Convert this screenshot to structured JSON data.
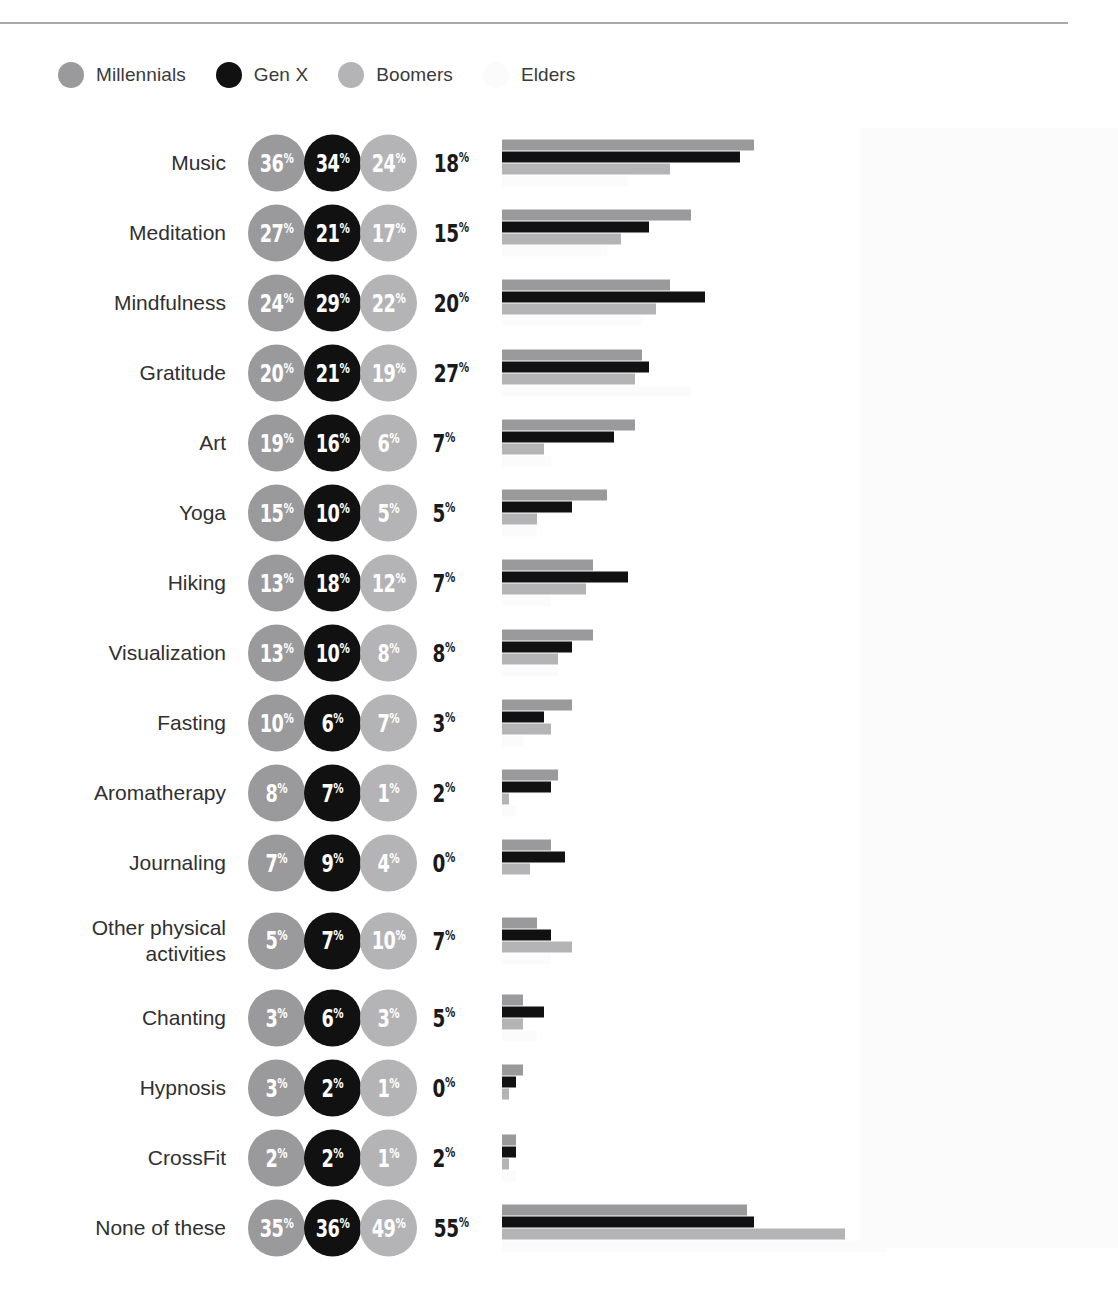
{
  "colors": {
    "millennials": "#9a9a9c",
    "genx": "#111111",
    "boomers": "#b4b4b6",
    "elders": "#fbfbfb",
    "elders_text": "#1a1a1a",
    "label_text": "#303032",
    "rule": "#a7a9ab",
    "background": "#ffffff"
  },
  "legend": {
    "items": [
      {
        "label": "Millennials",
        "color_key": "millennials"
      },
      {
        "label": "Gen X",
        "color_key": "genx"
      },
      {
        "label": "Boomers",
        "color_key": "boomers"
      },
      {
        "label": "Elders",
        "color_key": "elders"
      }
    ]
  },
  "chart_data": {
    "type": "bar",
    "title": "",
    "xlabel": "",
    "ylabel": "",
    "orientation": "horizontal",
    "grid": false,
    "legend_position": "top-left",
    "value_suffix": "%",
    "xlim": [
      0,
      60
    ],
    "px_per_percent": 7.0,
    "series": [
      {
        "name": "Millennials",
        "color": "#9a9a9c",
        "values": [
          36,
          27,
          24,
          20,
          19,
          15,
          13,
          13,
          10,
          8,
          7,
          5,
          3,
          3,
          2,
          35
        ]
      },
      {
        "name": "Gen X",
        "color": "#111111",
        "values": [
          34,
          21,
          29,
          21,
          16,
          10,
          18,
          10,
          6,
          7,
          9,
          7,
          6,
          2,
          2,
          36
        ]
      },
      {
        "name": "Boomers",
        "color": "#b4b4b6",
        "values": [
          24,
          17,
          22,
          19,
          6,
          5,
          12,
          8,
          7,
          1,
          4,
          10,
          3,
          1,
          1,
          49
        ]
      },
      {
        "name": "Elders",
        "color": "#fbfbfb",
        "values": [
          18,
          15,
          20,
          27,
          7,
          5,
          7,
          8,
          3,
          2,
          0,
          7,
          5,
          0,
          2,
          55
        ]
      }
    ],
    "categories": [
      "Music",
      "Meditation",
      "Mindfulness",
      "Gratitude",
      "Art",
      "Yoga",
      "Hiking",
      "Visualization",
      "Fasting",
      "Aromatherapy",
      "Journaling",
      "Other physical activities",
      "Chanting",
      "Hypnosis",
      "CrossFit",
      "None of these"
    ]
  },
  "rows": [
    {
      "label": "Music",
      "label_lines": [
        "Music"
      ],
      "millennials": "36",
      "genx": "34",
      "boomers": "24",
      "elders": "18",
      "tall": false
    },
    {
      "label": "Meditation",
      "label_lines": [
        "Meditation"
      ],
      "millennials": "27",
      "genx": "21",
      "boomers": "17",
      "elders": "15",
      "tall": false
    },
    {
      "label": "Mindfulness",
      "label_lines": [
        "Mindfulness"
      ],
      "millennials": "24",
      "genx": "29",
      "boomers": "22",
      "elders": "20",
      "tall": false
    },
    {
      "label": "Gratitude",
      "label_lines": [
        "Gratitude"
      ],
      "millennials": "20",
      "genx": "21",
      "boomers": "19",
      "elders": "27",
      "tall": false
    },
    {
      "label": "Art",
      "label_lines": [
        "Art"
      ],
      "millennials": "19",
      "genx": "16",
      "boomers": "6",
      "elders": "7",
      "tall": false
    },
    {
      "label": "Yoga",
      "label_lines": [
        "Yoga"
      ],
      "millennials": "15",
      "genx": "10",
      "boomers": "5",
      "elders": "5",
      "tall": false
    },
    {
      "label": "Hiking",
      "label_lines": [
        "Hiking"
      ],
      "millennials": "13",
      "genx": "18",
      "boomers": "12",
      "elders": "7",
      "tall": false
    },
    {
      "label": "Visualization",
      "label_lines": [
        "Visualization"
      ],
      "millennials": "13",
      "genx": "10",
      "boomers": "8",
      "elders": "8",
      "tall": false
    },
    {
      "label": "Fasting",
      "label_lines": [
        "Fasting"
      ],
      "millennials": "10",
      "genx": "6",
      "boomers": "7",
      "elders": "3",
      "tall": false
    },
    {
      "label": "Aromatherapy",
      "label_lines": [
        "Aromatherapy"
      ],
      "millennials": "8",
      "genx": "7",
      "boomers": "1",
      "elders": "2",
      "tall": false
    },
    {
      "label": "Journaling",
      "label_lines": [
        "Journaling"
      ],
      "millennials": "7",
      "genx": "9",
      "boomers": "4",
      "elders": "0",
      "tall": false
    },
    {
      "label": "Other physical activities",
      "label_lines": [
        "Other physical",
        "activities"
      ],
      "millennials": "5",
      "genx": "7",
      "boomers": "10",
      "elders": "7",
      "tall": true
    },
    {
      "label": "Chanting",
      "label_lines": [
        "Chanting"
      ],
      "millennials": "3",
      "genx": "6",
      "boomers": "3",
      "elders": "5",
      "tall": false
    },
    {
      "label": "Hypnosis",
      "label_lines": [
        "Hypnosis"
      ],
      "millennials": "3",
      "genx": "2",
      "boomers": "1",
      "elders": "0",
      "tall": false
    },
    {
      "label": "CrossFit",
      "label_lines": [
        "CrossFit"
      ],
      "millennials": "2",
      "genx": "2",
      "boomers": "1",
      "elders": "2",
      "tall": false
    },
    {
      "label": "None of these",
      "label_lines": [
        "None of these"
      ],
      "millennials": "35",
      "genx": "36",
      "boomers": "49",
      "elders": "55",
      "tall": false
    }
  ]
}
